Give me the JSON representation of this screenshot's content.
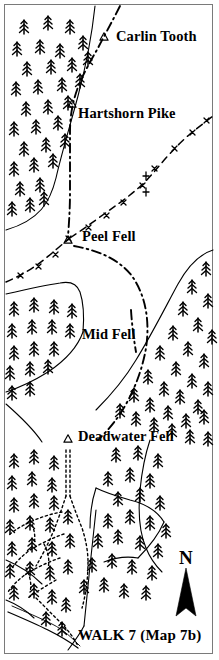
{
  "map": {
    "title": "WALK 7 (Map 7b)",
    "width": 219,
    "height": 660,
    "background_color": "#ffffff",
    "ink_color": "#000000",
    "frame_color": "#7a7a7a",
    "compass": {
      "letter": "N",
      "name": "north-arrow"
    },
    "peaks": [
      {
        "name": "Carlin Tooth",
        "label": "Carlin Tooth",
        "marker": "trig-point-triangle",
        "marker_x": 104,
        "marker_y": 37,
        "label_x": 116,
        "label_y": 29
      },
      {
        "name": "Hartshorn Pike",
        "label": "Hartshorn Pike",
        "marker": "trig-point-triangle",
        "marker_x": 72,
        "marker_y": 104,
        "label_x": 78,
        "label_y": 106
      },
      {
        "name": "Peel Fell",
        "label": "Peel Fell",
        "marker": "trig-point-triangle",
        "marker_x": 68,
        "marker_y": 240,
        "label_x": 82,
        "label_y": 229
      },
      {
        "name": "Mid Fell",
        "label": "Mid Fell",
        "marker": "none",
        "marker_x": 0,
        "marker_y": 0,
        "label_x": 82,
        "label_y": 327
      },
      {
        "name": "Deadwater Fell",
        "label": "Deadwater Fell",
        "marker": "trig-point-triangle",
        "marker_x": 68,
        "marker_y": 439,
        "label_x": 78,
        "label_y": 429
      }
    ],
    "legend_symbols": [
      "conifer-tree",
      "trig-point-triangle",
      "dash-dot-route",
      "fence-boundary",
      "dotted-track",
      "forest-edge"
    ]
  }
}
